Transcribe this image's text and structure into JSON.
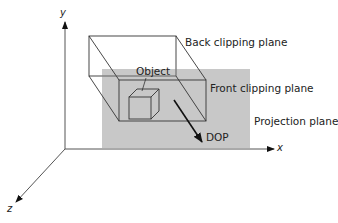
{
  "figure": {
    "labels": {
      "object": "Object",
      "back_clipping_plane": "Back clipping plane",
      "front_clipping_plane": "Front clipping plane",
      "projection_plane": "Projection plane",
      "dop": "DOP"
    },
    "axes": {
      "x": "x",
      "y": "y",
      "z": "z"
    },
    "colors": {
      "projection_plane_fill": "#c8c8c8",
      "line": "#222222",
      "axis_line": "#555555"
    }
  }
}
